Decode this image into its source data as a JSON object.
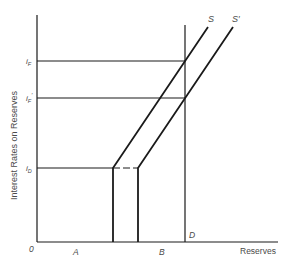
{
  "diagram": {
    "type": "reserves-market",
    "axes": {
      "y_label": "Interest Rates on Reserves",
      "x_label": "Reserves",
      "origin_label": "0"
    },
    "rate_levels": [
      {
        "id": "iF",
        "symbol": "i",
        "sub": "F",
        "prime": ""
      },
      {
        "id": "iF_prime",
        "symbol": "i",
        "sub": "F",
        "prime": "′"
      },
      {
        "id": "iD",
        "symbol": "i",
        "sub": "D",
        "prime": ""
      }
    ],
    "curves": {
      "supply": "S",
      "supply_shifted": "S′",
      "demand_point": "D"
    },
    "x_markers": {
      "a": "A",
      "b": "B"
    },
    "colors": {
      "line": "#1a1a1a",
      "label": "#4a4a4a",
      "background": "#ffffff"
    }
  }
}
